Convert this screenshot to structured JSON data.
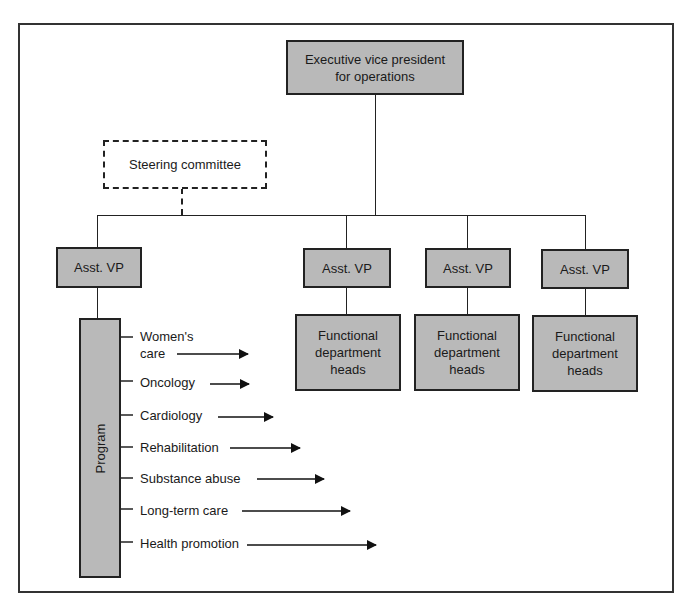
{
  "diagram": {
    "type": "organizational-chart",
    "executive": {
      "label": "Executive vice president for operations",
      "line1": "Executive vice president",
      "line2": "for operations"
    },
    "steering_committee": {
      "label": "Steering committee",
      "style": "dashed"
    },
    "assistant_vps": [
      {
        "label": "Asst. VP"
      },
      {
        "label": "Asst. VP"
      },
      {
        "label": "Asst. VP"
      },
      {
        "label": "Asst. VP"
      }
    ],
    "functional_heads": [
      {
        "line1": "Functional",
        "line2": "department",
        "line3": "heads"
      },
      {
        "line1": "Functional",
        "line2": "department",
        "line3": "heads"
      },
      {
        "line1": "Functional",
        "line2": "department",
        "line3": "heads"
      }
    ],
    "program": {
      "label": "Program",
      "items": [
        {
          "line1": "Women's",
          "line2": "care"
        },
        {
          "label": "Oncology"
        },
        {
          "label": "Cardiology"
        },
        {
          "label": "Rehabilitation"
        },
        {
          "label": "Substance abuse"
        },
        {
          "label": "Long-term care"
        },
        {
          "label": "Health promotion"
        }
      ]
    },
    "colors": {
      "box_fill": "#b9b9b9",
      "line": "#222222",
      "background": "#ffffff"
    }
  }
}
